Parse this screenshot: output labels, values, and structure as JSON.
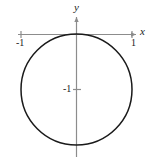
{
  "figure": {
    "background_color": "#ffffff",
    "axis_color": "#8c8c8c",
    "curve_color": "#1a1a1a",
    "width": 152,
    "height": 157
  },
  "labels": {
    "y_axis": "y",
    "x_axis": "x",
    "x_tick_negative_one": "-1",
    "x_tick_positive_one": "1",
    "y_tick_negative_one": "-1"
  },
  "chart_data": {
    "type": "line",
    "title": "",
    "xlabel": "x",
    "ylabel": "y",
    "xlim": [
      -1.45,
      1.6
    ],
    "ylim": [
      -2.4,
      0.65
    ],
    "grid": false,
    "legend": null,
    "axes": {
      "x_axis_y_value": 0,
      "y_axis_x_value": 0,
      "x_ticks": [
        -1,
        1
      ],
      "x_tick_labels": [
        "-1",
        "1"
      ],
      "y_ticks": [
        -1
      ],
      "y_tick_labels": [
        "-1"
      ],
      "x_axis_pixel_y": 34,
      "y_axis_pixel_x": 76,
      "x_axis_pixel_start": 18,
      "x_axis_pixel_end": 136,
      "y_axis_pixel_start": 17,
      "y_axis_pixel_end": 157
    },
    "series": [
      {
        "name": "circle",
        "shape": "circle",
        "equation": "x^2 + (y + 1)^2 = 1",
        "polar_equation": "r = -2 sin(theta)",
        "center": [
          0,
          -1
        ],
        "radius": 1,
        "closed": true,
        "pixel_center": [
          76,
          89.5
        ],
        "pixel_radius": 55.5,
        "stroke_width": 1.5
      }
    ],
    "annotations": [
      {
        "text": "-1",
        "x": -1,
        "y": 0,
        "pixel": [
          22,
          42
        ]
      },
      {
        "text": "1",
        "x": 1,
        "y": 0,
        "pixel": [
          133,
          42
        ]
      },
      {
        "text": "-1",
        "x": 0,
        "y": -1,
        "pixel": [
          68,
          89
        ]
      }
    ]
  }
}
